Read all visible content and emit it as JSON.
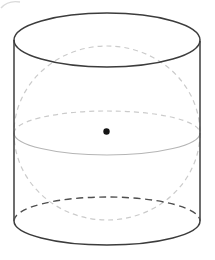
{
  "diagram": {
    "name": "sphere-inscribed-in-cylinder",
    "canvas": {
      "width": 215,
      "height": 260,
      "background": "#ffffff"
    },
    "colors": {
      "solid_edge": "#3c3c3c",
      "hidden_edge": "#4f4f4f",
      "sphere_outline": "#cbcbcb",
      "equator_front": "#b5b5b5",
      "artifact": "#dadada",
      "center_dot": "#141414"
    },
    "shapes": {
      "artifact_stroke": {
        "d": "M 1 8 Q 8 0 20 2",
        "stroke": "#dadada",
        "stroke-width": "1.4",
        "fill": "none"
      },
      "sphere_outline": {
        "cx": "107",
        "cy": "133",
        "rx": "93",
        "ry": "87",
        "stroke": "#cbcbcb",
        "stroke-width": "1.2",
        "stroke-dasharray": "5 4",
        "fill": "none"
      },
      "equator_back": {
        "d": "M 14 133 A 93 22 0 0 1 200 133",
        "stroke": "#cbcbcb",
        "stroke-width": "1.2",
        "stroke-dasharray": "5 4",
        "fill": "none"
      },
      "equator_front": {
        "d": "M 14 133 A 93 22 0 0 0 200 133",
        "stroke": "#b5b5b5",
        "stroke-width": "1.1",
        "fill": "none"
      },
      "cylinder_top_ellipse": {
        "cx": "107",
        "cy": "40",
        "rx": "93",
        "ry": "27",
        "stroke": "#3c3c3c",
        "stroke-width": "1.5",
        "fill": "none"
      },
      "cylinder_left_side": {
        "x1": "14",
        "y1": "40",
        "x2": "14",
        "y2": "221",
        "stroke": "#3c3c3c",
        "stroke-width": "1.5"
      },
      "cylinder_right_side": {
        "x1": "200",
        "y1": "41",
        "x2": "200",
        "y2": "221",
        "stroke": "#3c3c3c",
        "stroke-width": "1.5"
      },
      "cylinder_bottom_front": {
        "d": "M 14 221 A 93 24 0 0 0 200 221",
        "stroke": "#3c3c3c",
        "stroke-width": "1.5",
        "fill": "none"
      },
      "cylinder_bottom_back": {
        "d": "M 14 221 A 93 24 0 0 1 200 221",
        "stroke": "#4f4f4f",
        "stroke-width": "1.4",
        "stroke-dasharray": "7 4.5",
        "fill": "none"
      },
      "center_dot": {
        "cx": "106.5",
        "cy": "131.5",
        "r": "3.2",
        "fill": "#141414"
      }
    }
  }
}
